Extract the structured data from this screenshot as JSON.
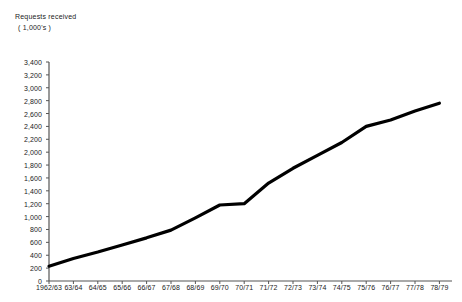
{
  "chart_data": {
    "type": "line",
    "title": "Requests received",
    "subtitle": "( 1,000's )",
    "xlabel": "",
    "ylabel": "Requests received ( 1,000's )",
    "ylim": [
      0,
      3400
    ],
    "ytick_step": 200,
    "grid": false,
    "legend": "none",
    "line_color": "#000000",
    "axis_color": "#555555",
    "categories": [
      "1962/63",
      "63/64",
      "64/65",
      "65/66",
      "66/67",
      "67/68",
      "68/69",
      "69/70",
      "70/71",
      "71/72",
      "72/73",
      "73/74",
      "74/75",
      "75/76",
      "76/77",
      "77/78",
      "78/79"
    ],
    "ytick_labels": [
      "3,400",
      "3,200",
      "3,000",
      "2,800",
      "2,600",
      "2,400",
      "2,200",
      "2,000",
      "1,800",
      "1,600",
      "1,400",
      "1,200",
      "1,000",
      "800",
      "600",
      "400",
      "200",
      "0"
    ],
    "ytick_values": [
      3400,
      3200,
      3000,
      2800,
      2600,
      2400,
      2200,
      2000,
      1800,
      1600,
      1400,
      1200,
      1000,
      800,
      600,
      400,
      200,
      0
    ],
    "series": [
      {
        "name": "Requests received",
        "values": [
          230,
          350,
          450,
          560,
          670,
          790,
          980,
          1180,
          1200,
          1520,
          1750,
          1950,
          2150,
          2400,
          2500,
          2640,
          2760
        ]
      }
    ]
  }
}
